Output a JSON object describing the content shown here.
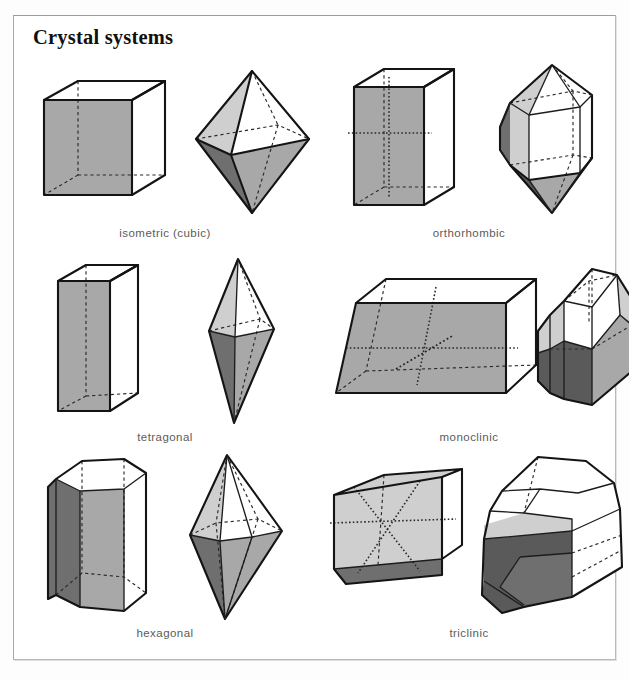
{
  "page": {
    "title": "Crystal systems",
    "background_color": "#ffffff",
    "frame_color": "#b9b9b9",
    "title_color": "#101010",
    "label_color": "#5b5b5b"
  },
  "palette": {
    "edge": "#141414",
    "hidden_edge": "#2a2a2a",
    "face_white": "#ffffff",
    "face_light": "#cfcfcf",
    "face_mid": "#a8a8a8",
    "face_dark": "#6f6f6f",
    "face_very_dark": "#5a5a5a"
  },
  "systems": [
    {
      "id": "isometric",
      "label": "isometric (cubic)",
      "shapes": [
        "cube",
        "octahedron"
      ]
    },
    {
      "id": "orthorhombic",
      "label": "orthorhombic",
      "shapes": [
        "rectangular-prism",
        "rhombic-dipyramid-prism"
      ]
    },
    {
      "id": "tetragonal",
      "label": "tetragonal",
      "shapes": [
        "square-prism",
        "tetragonal-dipyramid"
      ]
    },
    {
      "id": "monoclinic",
      "label": "monoclinic",
      "shapes": [
        "oblique-prism",
        "monoclinic-crystal"
      ]
    },
    {
      "id": "hexagonal",
      "label": "hexagonal",
      "shapes": [
        "hexagonal-prism",
        "hexagonal-dipyramid"
      ]
    },
    {
      "id": "triclinic",
      "label": "triclinic",
      "shapes": [
        "triclinic-parallelepiped",
        "triclinic-crystal"
      ]
    }
  ]
}
